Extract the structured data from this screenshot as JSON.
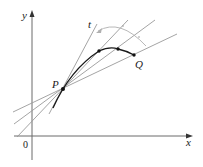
{
  "diagram": {
    "labels": {
      "x_axis": "x",
      "y_axis": "y",
      "origin": "0",
      "point_p": "P",
      "point_q": "Q",
      "tangent": "t"
    },
    "colors": {
      "axis": "#6b6b6b",
      "secant": "#9a9a9a",
      "curve": "#1a1a1a",
      "arc": "#b0b0b0",
      "point": "#111111"
    },
    "points": {
      "P": [
        63,
        89
      ],
      "intermediate": [
        [
          99,
          51
        ],
        [
          118,
          49
        ]
      ],
      "Q": [
        134,
        55
      ]
    }
  }
}
